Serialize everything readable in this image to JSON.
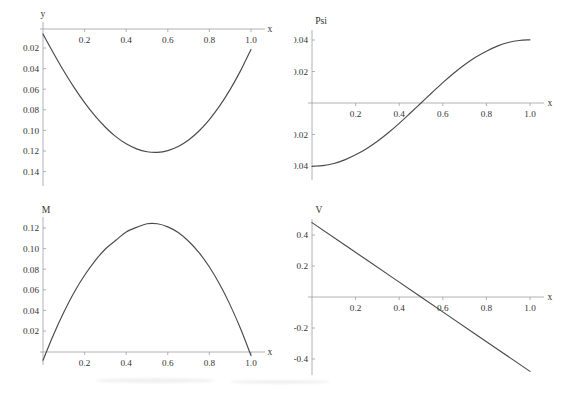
{
  "figure": {
    "background": "#ffffff",
    "curve_color": "#4a4a4a",
    "axis_color": "#9aa0a6",
    "text_color": "#333333"
  },
  "chart_data": [
    {
      "type": "line",
      "id": "deflection",
      "title": "",
      "ylabel": "y",
      "xlabel": "x",
      "xlim": [
        0,
        1.05
      ],
      "ylim": [
        0,
        0.15
      ],
      "y_axis_inverted": true,
      "grid": false,
      "legend": null,
      "xticks": [
        0.2,
        0.4,
        0.6,
        0.8,
        1.0
      ],
      "xtick_labels": [
        "0.2",
        "0.4",
        "0.6",
        "0.8",
        "1.0"
      ],
      "yticks": [
        0.02,
        0.04,
        0.06,
        0.08,
        0.1,
        0.12,
        0.14
      ],
      "ytick_labels": [
        "0.02",
        "0.04",
        "0.06",
        "0.08",
        "0.10",
        "0.12",
        "0.14"
      ],
      "x": [
        0.0,
        0.05,
        0.1,
        0.15,
        0.2,
        0.25,
        0.3,
        0.35,
        0.4,
        0.45,
        0.5,
        0.55,
        0.6,
        0.65,
        0.7,
        0.75,
        0.8,
        0.85,
        0.9,
        0.95,
        1.0
      ],
      "values": [
        0.005,
        0.0235,
        0.0412,
        0.0575,
        0.0722,
        0.0852,
        0.0963,
        0.1055,
        0.1126,
        0.1175,
        0.1203,
        0.1209,
        0.1192,
        0.1152,
        0.1088,
        0.1,
        0.0888,
        0.0752,
        0.0592,
        0.0408,
        0.02
      ]
    },
    {
      "type": "line",
      "id": "slope",
      "title": "",
      "ylabel": "Psi",
      "xlabel": "x",
      "xlim": [
        0,
        1.05
      ],
      "ylim": [
        -0.05,
        0.05
      ],
      "y_axis_inverted": false,
      "grid": false,
      "legend": null,
      "xticks": [
        0.2,
        0.4,
        0.6,
        0.8,
        1.0
      ],
      "xtick_labels": [
        "0.2",
        "0.4",
        "0.6",
        "0.8",
        "1.0"
      ],
      "yticks": [
        -0.04,
        -0.02,
        0.02,
        0.04
      ],
      "ytick_labels": [
        "-0.04",
        "-0.02",
        "0.02",
        "0.04"
      ],
      "x": [
        0.0,
        0.05,
        0.1,
        0.15,
        0.2,
        0.25,
        0.3,
        0.35,
        0.4,
        0.45,
        0.5,
        0.55,
        0.6,
        0.65,
        0.7,
        0.75,
        0.8,
        0.85,
        0.9,
        0.95,
        1.0
      ],
      "values": [
        -0.0402,
        -0.0398,
        -0.0384,
        -0.0361,
        -0.0329,
        -0.029,
        -0.0243,
        -0.0189,
        -0.0129,
        -0.0065,
        0.0,
        0.0065,
        0.0129,
        0.0189,
        0.0243,
        0.029,
        0.0329,
        0.0361,
        0.0384,
        0.0397,
        0.0401
      ]
    },
    {
      "type": "line",
      "id": "moment",
      "title": "",
      "ylabel": "M",
      "xlabel": "x",
      "xlim": [
        0,
        1.05
      ],
      "ylim": [
        0,
        0.13
      ],
      "y_axis_inverted": false,
      "grid": false,
      "legend": null,
      "xticks": [
        0.2,
        0.4,
        0.6,
        0.8,
        1.0
      ],
      "xtick_labels": [
        "0.2",
        "0.4",
        "0.6",
        "0.8",
        "1.0"
      ],
      "yticks": [
        0.02,
        0.04,
        0.06,
        0.08,
        0.1,
        0.12
      ],
      "ytick_labels": [
        "0.02",
        "0.04",
        "0.06",
        "0.08",
        "0.10",
        "0.12"
      ],
      "x": [
        0.0,
        0.05,
        0.1,
        0.15,
        0.2,
        0.25,
        0.3,
        0.35,
        0.4,
        0.45,
        0.5,
        0.55,
        0.6,
        0.65,
        0.7,
        0.75,
        0.8,
        0.85,
        0.9,
        0.95,
        1.0
      ],
      "values": [
        -0.008,
        0.0165,
        0.0385,
        0.058,
        0.0745,
        0.0885,
        0.1,
        0.1085,
        0.1165,
        0.121,
        0.1245,
        0.1245,
        0.1215,
        0.116,
        0.1075,
        0.0965,
        0.0825,
        0.0655,
        0.0455,
        0.0225,
        -0.0035
      ]
    },
    {
      "type": "line",
      "id": "shear",
      "title": "",
      "ylabel": "V",
      "xlabel": "x",
      "xlim": [
        0,
        1.05
      ],
      "ylim": [
        -0.52,
        0.52
      ],
      "y_axis_inverted": false,
      "grid": false,
      "legend": null,
      "xticks": [
        0.2,
        0.4,
        0.6,
        0.8,
        1.0
      ],
      "xtick_labels": [
        "0.2",
        "0.4",
        "0.6",
        "0.8",
        "1.0"
      ],
      "yticks": [
        -0.4,
        -0.2,
        0.2,
        0.4
      ],
      "ytick_labels": [
        "-0.4",
        "-0.2",
        "0.2",
        "0.4"
      ],
      "x": [
        0.0,
        0.25,
        0.5,
        0.75,
        1.0
      ],
      "values": [
        0.48,
        0.24,
        0.0,
        -0.24,
        -0.48
      ]
    }
  ]
}
